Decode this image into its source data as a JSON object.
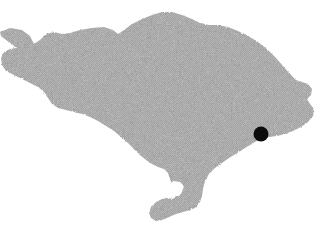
{
  "figure": {
    "name": "bali-island-outline-map",
    "width": 329,
    "height": 244,
    "background_color": "#ffffff",
    "has_labels": false,
    "has_text": false,
    "has_legend": false,
    "has_scale_bar": false,
    "has_north_arrow": false,
    "has_border": false
  },
  "landmass": {
    "name": "bali-island",
    "fill_color": "#a8a8a8",
    "fill_style": "halftone-dither",
    "stroke": "none",
    "outline_path": "M 0,32 L 10,28 L 22,30 L 30,36 L 34,44 L 40,40 L 46,34 L 54,32 L 62,34 L 70,33 L 80,30 L 92,28 L 104,27 L 113,30 L 118,34 L 124,30 L 132,24 L 142,19 L 152,15 L 162,12 L 172,12 L 182,15 L 192,19 L 200,23 L 209,25 L 218,25 L 228,27 L 238,31 L 248,36 L 258,42 L 268,50 L 276,58 L 283,66 L 290,74 L 296,80 L 302,82 L 308,84 L 312,89 L 311,95 L 307,99 L 310,104 L 314,109 L 313,116 L 308,122 L 301,127 L 293,131 L 285,134 L 277,136 L 269,137 L 261,139 L 253,143 L 245,148 L 237,153 L 229,158 L 222,163 L 215,168 L 209,174 L 205,181 L 203,189 L 202,196 L 200,202 L 196,207 L 190,210 L 183,212 L 176,214 L 169,217 L 162,220 L 156,221 L 151,218 L 149,213 L 151,207 L 156,202 L 162,199 L 168,198 L 173,199 L 176,196 L 175,190 L 172,185 L 170,179 L 168,173 L 164,169 L 158,167 L 152,164 L 146,160 L 140,155 L 134,149 L 128,143 L 121,137 L 114,131 L 106,126 L 98,121 L 90,117 L 82,114 L 74,112 L 66,110 L 58,108 L 52,104 L 48,98 L 44,92 L 38,87 L 30,83 L 22,79 L 14,75 L 6,71 L 2,65 L 1,58 L 4,52 L 10,49 L 16,48 L 12,44 L 6,40 L 1,36 Z",
    "inner_bay_path": "M 176,196 L 172,190 L 170,183 L 174,181 L 180,182 L 184,186 L 182,192 L 179,196 Z"
  },
  "markers": [
    {
      "name": "location-dot",
      "label": "",
      "shape": "circle",
      "color": "#0d0d0d",
      "x": 261,
      "y": 134,
      "radius": 7.5
    }
  ],
  "colors": {
    "land": "#a8a8a8",
    "water": "#ffffff",
    "marker": "#0d0d0d"
  }
}
